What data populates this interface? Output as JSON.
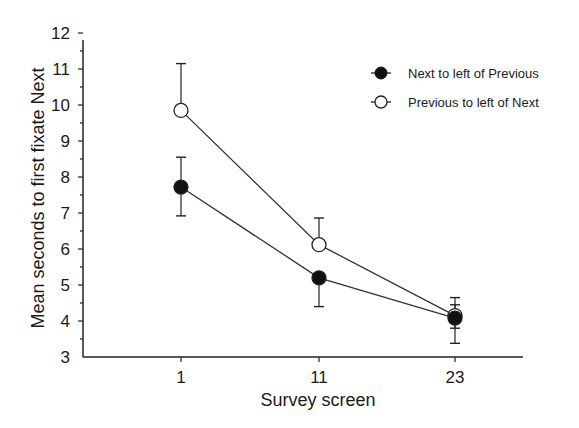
{
  "chart_data": {
    "type": "line",
    "title": "",
    "xlabel": "Survey screen",
    "ylabel": "Mean seconds to first fixate Next",
    "categories": [
      "1",
      "11",
      "23"
    ],
    "ylim": [
      3,
      12
    ],
    "yticks": [
      3,
      4,
      5,
      6,
      7,
      8,
      9,
      10,
      11,
      12
    ],
    "grid": false,
    "legend_position": "upper right",
    "series": [
      {
        "name": "Next to left of Previous",
        "marker": "filled-circle",
        "values": [
          7.72,
          5.2,
          4.08
        ],
        "error_upper": [
          8.55,
          5.2,
          4.45
        ],
        "error_lower": [
          6.92,
          4.4,
          3.38
        ]
      },
      {
        "name": "Previous to left of Next",
        "marker": "open-circle",
        "values": [
          9.85,
          6.12,
          4.15
        ],
        "error_upper": [
          11.15,
          6.86,
          4.65
        ],
        "error_lower": [
          9.85,
          6.12,
          3.8
        ]
      }
    ]
  },
  "legend": {
    "items": [
      "Next to left of Previous",
      "Previous to left of Next"
    ]
  },
  "axes": {
    "x_title": "Survey screen",
    "y_title": "Mean seconds to first fixate Next"
  }
}
